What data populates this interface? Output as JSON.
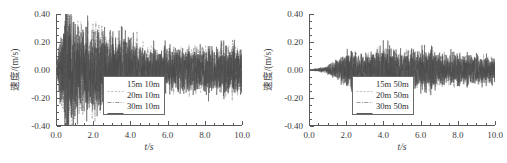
{
  "figure": {
    "background": "#ffffff",
    "axis_color": "#5a5a5a"
  },
  "chart_data": [
    {
      "type": "line",
      "panel": "left",
      "title": "",
      "xlabel": "t/s",
      "ylabel": "速度/(m/s)",
      "xlim": [
        0.0,
        10.0
      ],
      "ylim": [
        -0.4,
        0.4
      ],
      "xticks": [
        "0.0",
        "2.0",
        "4.0",
        "6.0",
        "8.0",
        "10.0"
      ],
      "xtick_values": [
        0.0,
        2.0,
        4.0,
        6.0,
        8.0,
        10.0
      ],
      "yticks": [
        "0.40",
        "0.20",
        "0.00",
        "-0.20",
        "-0.40"
      ],
      "ytick_values": [
        0.4,
        0.2,
        0.0,
        -0.2,
        -0.4
      ],
      "xminor_step": 0.5,
      "yminor_step": 0.05,
      "grid": false,
      "legend_position": "lower-right",
      "series": [
        {
          "name": "15m 10m",
          "color": "#b4b4b4",
          "dash": "2,1.6",
          "width": 0.55,
          "envelope": [
            {
              "t": 0.0,
              "a": 0.02
            },
            {
              "t": 0.3,
              "a": 0.2
            },
            {
              "t": 0.6,
              "a": 0.34
            },
            {
              "t": 1.0,
              "a": 0.26
            },
            {
              "t": 1.6,
              "a": 0.2
            },
            {
              "t": 2.3,
              "a": 0.22
            },
            {
              "t": 3.0,
              "a": 0.18
            },
            {
              "t": 3.6,
              "a": 0.19
            },
            {
              "t": 4.5,
              "a": 0.13
            },
            {
              "t": 5.5,
              "a": 0.11
            },
            {
              "t": 6.5,
              "a": 0.11
            },
            {
              "t": 7.5,
              "a": 0.12
            },
            {
              "t": 8.5,
              "a": 0.1
            },
            {
              "t": 9.4,
              "a": 0.14
            },
            {
              "t": 10.0,
              "a": 0.11
            }
          ]
        },
        {
          "name": "20m 10m",
          "color": "#8a8a8a",
          "dash": "4,1.4,1,1.4",
          "width": 0.55,
          "envelope": [
            {
              "t": 0.0,
              "a": 0.02
            },
            {
              "t": 0.3,
              "a": 0.22
            },
            {
              "t": 0.65,
              "a": 0.4
            },
            {
              "t": 1.0,
              "a": 0.28
            },
            {
              "t": 1.6,
              "a": 0.22
            },
            {
              "t": 2.3,
              "a": 0.24
            },
            {
              "t": 3.0,
              "a": 0.2
            },
            {
              "t": 3.6,
              "a": 0.2
            },
            {
              "t": 4.5,
              "a": 0.14
            },
            {
              "t": 5.5,
              "a": 0.12
            },
            {
              "t": 6.5,
              "a": 0.12
            },
            {
              "t": 7.5,
              "a": 0.13
            },
            {
              "t": 8.5,
              "a": 0.11
            },
            {
              "t": 9.4,
              "a": 0.15
            },
            {
              "t": 10.0,
              "a": 0.12
            }
          ]
        },
        {
          "name": "30m 10m",
          "color": "#4a4a4a",
          "dash": "0",
          "width": 0.5,
          "envelope": [
            {
              "t": 0.0,
              "a": 0.02
            },
            {
              "t": 0.3,
              "a": 0.24
            },
            {
              "t": 0.62,
              "a": 0.45
            },
            {
              "t": 1.0,
              "a": 0.3
            },
            {
              "t": 1.6,
              "a": 0.24
            },
            {
              "t": 2.3,
              "a": 0.25
            },
            {
              "t": 3.0,
              "a": 0.21
            },
            {
              "t": 3.6,
              "a": 0.22
            },
            {
              "t": 4.5,
              "a": 0.15
            },
            {
              "t": 5.5,
              "a": 0.13
            },
            {
              "t": 6.5,
              "a": 0.13
            },
            {
              "t": 7.5,
              "a": 0.14
            },
            {
              "t": 8.5,
              "a": 0.12
            },
            {
              "t": 9.4,
              "a": 0.16
            },
            {
              "t": 10.0,
              "a": 0.13
            }
          ]
        }
      ]
    },
    {
      "type": "line",
      "panel": "right",
      "title": "",
      "xlabel": "t/s",
      "ylabel": "速度/(m/s)",
      "xlim": [
        0.0,
        10.0
      ],
      "ylim": [
        -0.4,
        0.4
      ],
      "xticks": [
        "0.0",
        "2.0",
        "4.0",
        "6.0",
        "8.0",
        "10.0"
      ],
      "xtick_values": [
        0.0,
        2.0,
        4.0,
        6.0,
        8.0,
        10.0
      ],
      "yticks": [
        "0.40",
        "0.20",
        "0.00",
        "-0.20",
        "-0.40"
      ],
      "ytick_values": [
        0.4,
        0.2,
        0.0,
        -0.2,
        -0.4
      ],
      "xminor_step": 0.5,
      "yminor_step": 0.05,
      "grid": false,
      "legend_position": "lower-right",
      "series": [
        {
          "name": "15m 50m",
          "color": "#b8b8b8",
          "dash": "2,1.6",
          "width": 0.55,
          "envelope": [
            {
              "t": 0.0,
              "a": 0.004
            },
            {
              "t": 0.8,
              "a": 0.012
            },
            {
              "t": 1.3,
              "a": 0.035
            },
            {
              "t": 1.9,
              "a": 0.075
            },
            {
              "t": 2.4,
              "a": 0.095
            },
            {
              "t": 3.0,
              "a": 0.08
            },
            {
              "t": 3.6,
              "a": 0.09
            },
            {
              "t": 4.1,
              "a": 0.125
            },
            {
              "t": 4.8,
              "a": 0.085
            },
            {
              "t": 5.5,
              "a": 0.09
            },
            {
              "t": 6.4,
              "a": 0.105
            },
            {
              "t": 7.2,
              "a": 0.075
            },
            {
              "t": 8.2,
              "a": 0.07
            },
            {
              "t": 9.2,
              "a": 0.075
            },
            {
              "t": 10.0,
              "a": 0.055
            }
          ]
        },
        {
          "name": "20m 50m",
          "color": "#8e8e8e",
          "dash": "4,1.4,1,1.4",
          "width": 0.55,
          "envelope": [
            {
              "t": 0.0,
              "a": 0.004
            },
            {
              "t": 0.8,
              "a": 0.014
            },
            {
              "t": 1.3,
              "a": 0.04
            },
            {
              "t": 1.9,
              "a": 0.085
            },
            {
              "t": 2.4,
              "a": 0.105
            },
            {
              "t": 3.0,
              "a": 0.09
            },
            {
              "t": 3.6,
              "a": 0.1
            },
            {
              "t": 4.1,
              "a": 0.14
            },
            {
              "t": 4.8,
              "a": 0.095
            },
            {
              "t": 5.5,
              "a": 0.1
            },
            {
              "t": 6.4,
              "a": 0.115
            },
            {
              "t": 7.2,
              "a": 0.085
            },
            {
              "t": 8.2,
              "a": 0.08
            },
            {
              "t": 9.2,
              "a": 0.085
            },
            {
              "t": 10.0,
              "a": 0.06
            }
          ]
        },
        {
          "name": "30m 50m",
          "color": "#4a4a4a",
          "dash": "0",
          "width": 0.5,
          "envelope": [
            {
              "t": 0.0,
              "a": 0.004
            },
            {
              "t": 0.8,
              "a": 0.016
            },
            {
              "t": 1.3,
              "a": 0.045
            },
            {
              "t": 1.9,
              "a": 0.095
            },
            {
              "t": 2.4,
              "a": 0.12
            },
            {
              "t": 3.0,
              "a": 0.1
            },
            {
              "t": 3.6,
              "a": 0.11
            },
            {
              "t": 4.1,
              "a": 0.155
            },
            {
              "t": 4.8,
              "a": 0.105
            },
            {
              "t": 5.5,
              "a": 0.11
            },
            {
              "t": 6.4,
              "a": 0.13
            },
            {
              "t": 7.2,
              "a": 0.095
            },
            {
              "t": 8.2,
              "a": 0.09
            },
            {
              "t": 9.2,
              "a": 0.095
            },
            {
              "t": 10.0,
              "a": 0.065
            }
          ]
        }
      ]
    }
  ]
}
